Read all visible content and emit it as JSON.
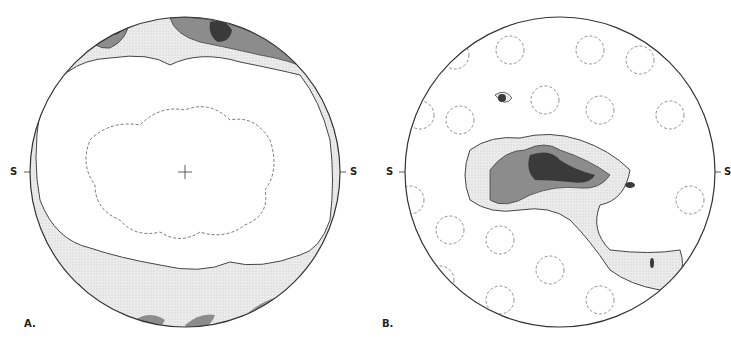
{
  "figure": {
    "panels": [
      {
        "id": "A",
        "label": "A.",
        "side_label_left": "S",
        "side_label_right": "S",
        "center_mark": "+"
      },
      {
        "id": "B",
        "label": "B.",
        "side_label_left": "S",
        "side_label_right": "S"
      }
    ],
    "colors": {
      "outline": "#333333",
      "light_stipple": "#e6e6e6",
      "medium": "#8c8c8c",
      "dark": "#3a3a3a",
      "background": "#ffffff"
    }
  }
}
